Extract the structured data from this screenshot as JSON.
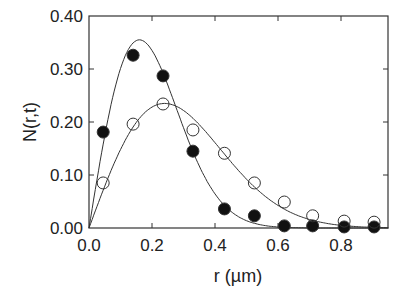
{
  "chart_data": {
    "type": "scatter",
    "title": "",
    "xlabel": "r (µm)",
    "ylabel": "N(r,t)",
    "xlim": [
      0.0,
      0.95
    ],
    "ylim": [
      0.0,
      0.4
    ],
    "grid": false,
    "legend": null,
    "x_ticks": [
      "0.0",
      "0.2",
      "0.4",
      "0.6",
      "0.8"
    ],
    "x_tick_values": [
      0.0,
      0.2,
      0.4,
      0.6,
      0.8
    ],
    "y_ticks": [
      "0.00",
      "0.10",
      "0.20",
      "0.30",
      "0.40"
    ],
    "y_tick_values": [
      0.0,
      0.1,
      0.2,
      0.3,
      0.4
    ],
    "series": [
      {
        "name": "filled circles",
        "marker": "filled-circle",
        "x": [
          0.045,
          0.14,
          0.235,
          0.33,
          0.43,
          0.525,
          0.62,
          0.71,
          0.81,
          0.905
        ],
        "y": [
          0.181,
          0.326,
          0.287,
          0.145,
          0.036,
          0.023,
          0.004,
          0.004,
          0.002,
          0.002
        ],
        "fit": {
          "type": "curve",
          "peak_x": 0.16,
          "peak_y": 0.355
        }
      },
      {
        "name": "open circles",
        "marker": "open-circle",
        "x": [
          0.045,
          0.14,
          0.235,
          0.33,
          0.43,
          0.525,
          0.62,
          0.71,
          0.81,
          0.905
        ],
        "y": [
          0.085,
          0.196,
          0.234,
          0.185,
          0.141,
          0.085,
          0.049,
          0.023,
          0.013,
          0.011
        ],
        "fit": {
          "type": "curve",
          "peak_x": 0.24,
          "peak_y": 0.235
        }
      }
    ]
  }
}
